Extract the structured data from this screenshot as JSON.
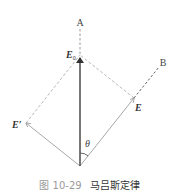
{
  "diagram": {
    "labels": {
      "axis_a": "A",
      "axis_b": "B",
      "e0": "E",
      "e0_sub": "0",
      "e": "E",
      "e_prime": "E′",
      "theta": "θ"
    },
    "colors": {
      "main_vector": "#555555",
      "component_vectors": "#a8a8a8",
      "dashed_lines": "#9a9a9a",
      "axis_b_dashed": "#666666"
    }
  },
  "caption": {
    "number": "图 10-29",
    "title": "马吕斯定律"
  }
}
